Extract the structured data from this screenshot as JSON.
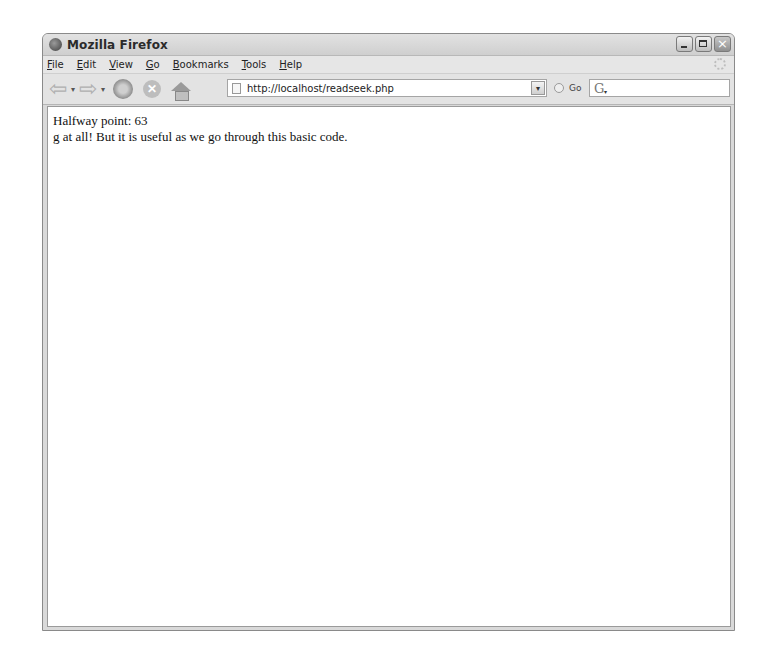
{
  "window": {
    "title": "Mozilla Firefox",
    "controls": {
      "minimize": "minimize",
      "maximize": "maximize",
      "close": "×"
    }
  },
  "menubar": {
    "items": [
      {
        "accel": "F",
        "rest": "ile"
      },
      {
        "accel": "E",
        "rest": "dit"
      },
      {
        "accel": "V",
        "rest": "iew"
      },
      {
        "accel": "G",
        "rest": "o"
      },
      {
        "accel": "B",
        "rest": "ookmarks"
      },
      {
        "accel": "T",
        "rest": "ools"
      },
      {
        "accel": "H",
        "rest": "elp"
      }
    ]
  },
  "navbar": {
    "back_glyph": "⇦",
    "forward_glyph": "⇨",
    "dropdown_glyph": "▾",
    "stop_glyph": "✕",
    "url": "http://localhost/readseek.php",
    "url_dropdown_glyph": "▾",
    "go_label": "Go",
    "search_engine_glyph": "G",
    "search_dropdown_glyph": "▾"
  },
  "content": {
    "lines": [
      "Halfway point: 63",
      "g at all! But it is useful as we go through this basic code."
    ]
  }
}
